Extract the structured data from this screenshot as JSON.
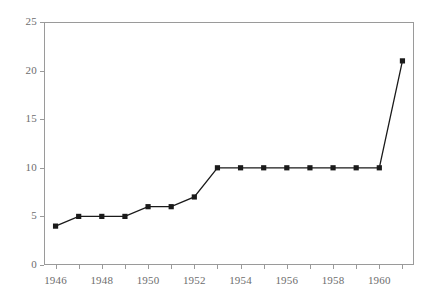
{
  "chart_data": {
    "type": "line",
    "title": "",
    "subtitle": "",
    "xlabel": "",
    "ylabel": "",
    "x": [
      1946,
      1947,
      1948,
      1949,
      1950,
      1951,
      1952,
      1953,
      1954,
      1955,
      1956,
      1957,
      1958,
      1959,
      1960,
      1961
    ],
    "values": [
      4,
      5,
      5,
      5,
      6,
      6,
      7,
      10,
      10,
      10,
      10,
      10,
      10,
      10,
      10,
      21
    ],
    "series": [
      {
        "name": "series-1",
        "values": [
          4,
          5,
          5,
          5,
          6,
          6,
          7,
          10,
          10,
          10,
          10,
          10,
          10,
          10,
          10,
          21
        ]
      }
    ],
    "xlim": [
      1945.5,
      1961.5
    ],
    "ylim": [
      0,
      25
    ],
    "ytick_values": [
      0,
      5,
      10,
      15,
      20,
      25
    ],
    "ytick_labels": [
      "0",
      "5",
      "10",
      "15",
      "20",
      "25"
    ],
    "xtick_values": [
      1946,
      1947,
      1948,
      1949,
      1950,
      1951,
      1952,
      1953,
      1954,
      1955,
      1956,
      1957,
      1958,
      1959,
      1960,
      1961
    ],
    "xtick_labels_shown": [
      "1946",
      "1948",
      "1950",
      "1952",
      "1954",
      "1956",
      "1958",
      "1960"
    ],
    "xtick_labeled_values": [
      1946,
      1948,
      1950,
      1952,
      1954,
      1956,
      1958,
      1960
    ],
    "grid": false,
    "legend": null,
    "legend_position": "none",
    "marker": "square",
    "line_color": "#1a1a1a",
    "marker_color": "#1a1a1a",
    "axis_color": "#9a9a9a",
    "tick_label_color": "#6d6d6d",
    "background_color": "#ffffff",
    "annotations": []
  },
  "geometry": {
    "plot_left": 44,
    "plot_right": 414,
    "plot_top": 22,
    "plot_bottom": 265
  }
}
